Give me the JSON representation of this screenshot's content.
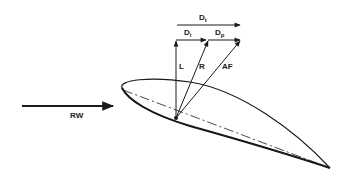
{
  "diagram": {
    "type": "airfoil force vector diagram",
    "colors": {
      "ink": "#1a1a1a",
      "background": "#ffffff"
    },
    "labels": {
      "total_drag": {
        "main": "D",
        "sub": "t"
      },
      "induced_drag": {
        "main": "D",
        "sub": "i"
      },
      "profile_drag": {
        "main": "D",
        "sub": "p"
      },
      "lift": "L",
      "resultant": "R",
      "aerodynamic_force": "AF",
      "relative_wind": "RW"
    }
  }
}
